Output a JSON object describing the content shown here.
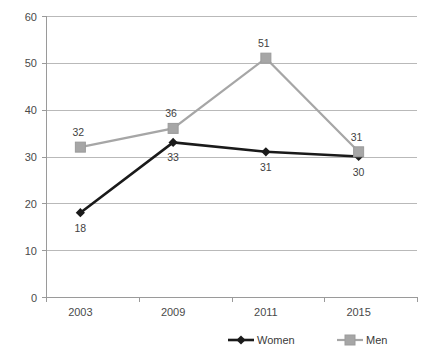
{
  "chart_data": {
    "type": "line",
    "title": "",
    "xlabel": "",
    "ylabel": "",
    "categories": [
      "2003",
      "2009",
      "2011",
      "2015"
    ],
    "series": [
      {
        "name": "Women",
        "color": "#1a1a1a",
        "marker": "diamond",
        "values": [
          18,
          33,
          31,
          30
        ],
        "label_position": "below"
      },
      {
        "name": "Men",
        "color": "#a6a6a6",
        "marker": "square",
        "values": [
          32,
          36,
          51,
          31
        ],
        "label_position": "above"
      }
    ],
    "ylim": [
      0,
      60
    ],
    "ytick_step": 10,
    "yticks": [
      "0",
      "10",
      "20",
      "30",
      "40",
      "50",
      "60"
    ],
    "grid": "horizontal",
    "legend_position": "bottom",
    "legend": [
      {
        "label": "Women",
        "color": "#1a1a1a",
        "marker": "diamond"
      },
      {
        "label": "Men",
        "color": "#a6a6a6",
        "marker": "square"
      }
    ]
  }
}
